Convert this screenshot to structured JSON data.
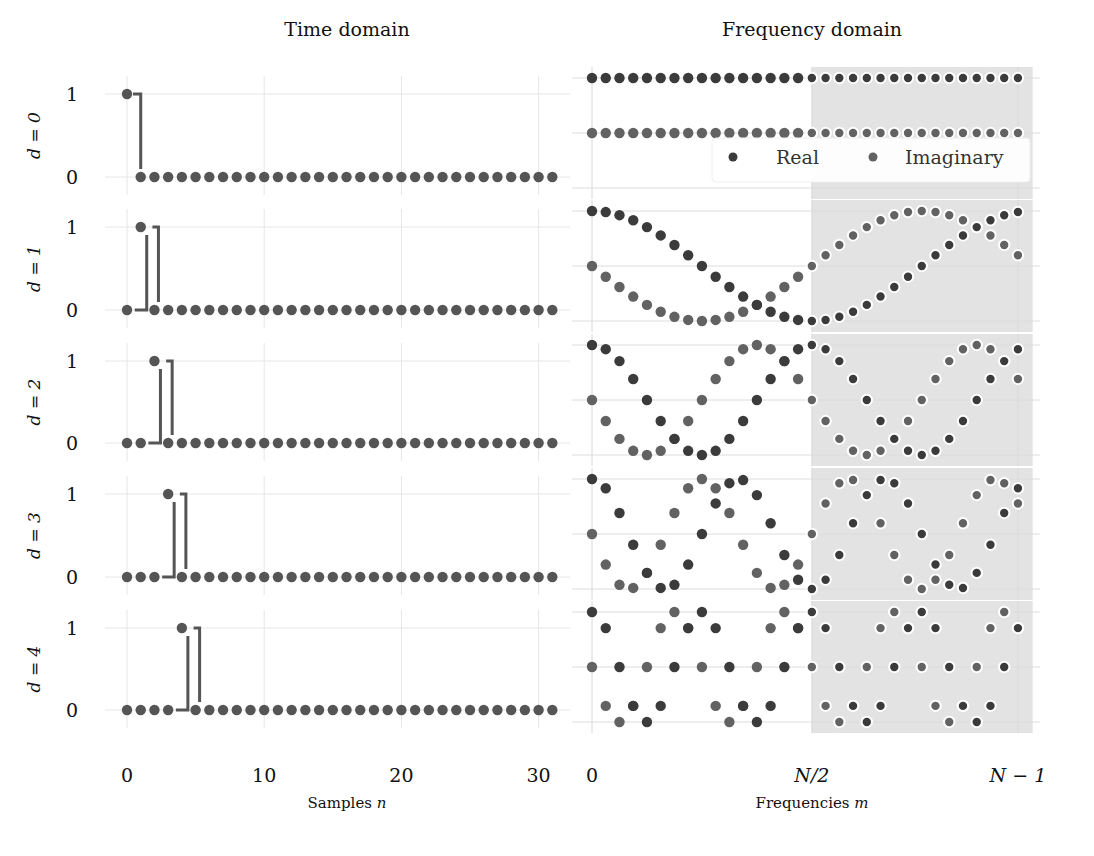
{
  "figure": {
    "left_title": "Time domain",
    "right_title": "Frequency domain",
    "left_xlabel": "Samples n",
    "left_xlabel_var": "n",
    "left_xlabel_text": "Samples ",
    "right_xlabel_text": "Frequencies ",
    "right_xlabel_var": "m",
    "left_xticks": [
      "0",
      "10",
      "20",
      "30"
    ],
    "right_xticks": [
      "0",
      "N/2",
      "N − 1"
    ],
    "left_yticks": [
      "1",
      "0"
    ],
    "row_labels": [
      "d = 0",
      "d = 1",
      "d = 2",
      "d = 3",
      "d = 4"
    ],
    "legend": [
      {
        "label": "Real",
        "color": "#3b3b3b"
      },
      {
        "label": "Imaginary",
        "color": "#626262"
      }
    ],
    "colors": {
      "real": "#3b3b3b",
      "imag": "#626262",
      "stem": "#555555",
      "time_marker": "#555555",
      "shade": "#e3e3e3",
      "grid": "#e6e6e6"
    }
  },
  "chart_data": [
    {
      "type": "scatter",
      "title": "Time domain",
      "xlabel": "Samples n",
      "ylabel": "d",
      "N": 32,
      "x": [
        0,
        1,
        2,
        3,
        4,
        5,
        6,
        7,
        8,
        9,
        10,
        11,
        12,
        13,
        14,
        15,
        16,
        17,
        18,
        19,
        20,
        21,
        22,
        23,
        24,
        25,
        26,
        27,
        28,
        29,
        30,
        31
      ],
      "xticks": [
        0,
        10,
        20,
        30
      ],
      "yticks": [
        0,
        1
      ],
      "ylim": [
        0,
        1
      ],
      "rows": [
        {
          "label": "d = 0",
          "delay": 0,
          "impulse_index": 0
        },
        {
          "label": "d = 1",
          "delay": 1,
          "impulse_index": 1
        },
        {
          "label": "d = 2",
          "delay": 2,
          "impulse_index": 2
        },
        {
          "label": "d = 3",
          "delay": 3,
          "impulse_index": 3
        },
        {
          "label": "d = 4",
          "delay": 4,
          "impulse_index": 4
        }
      ],
      "description": "Unit impulse delayed by d samples: x[n] = 1 if n = d else 0, with a step line outlining the impulse"
    },
    {
      "type": "scatter",
      "title": "Frequency domain",
      "xlabel": "Frequencies m",
      "N": 32,
      "xticks": [
        "0",
        "N/2",
        "N − 1"
      ],
      "xtick_values": [
        0,
        16,
        31
      ],
      "ylim": [
        -1,
        1
      ],
      "shaded_region": {
        "from": 16,
        "to": 31
      },
      "legend": [
        "Real",
        "Imaginary"
      ],
      "legend_position": "upper right of first frequency panel",
      "series_formula": {
        "Real": "cos(2π m d / N)",
        "Imaginary": "-sin(2π m d / N)"
      },
      "rows": [
        {
          "label": "d = 0",
          "delay": 0
        },
        {
          "label": "d = 1",
          "delay": 1
        },
        {
          "label": "d = 2",
          "delay": 2
        },
        {
          "label": "d = 3",
          "delay": 3
        },
        {
          "label": "d = 4",
          "delay": 4
        }
      ]
    }
  ]
}
